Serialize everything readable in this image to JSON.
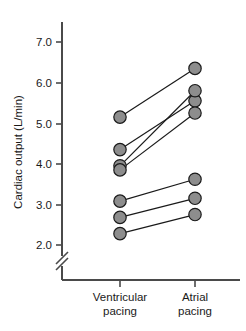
{
  "chart_data": {
    "type": "line",
    "title": "",
    "xlabel": "",
    "ylabel": "Cardiac output (L/min)",
    "categories": [
      "Ventricular pacing",
      "Atrial pacing"
    ],
    "x": [
      1,
      2
    ],
    "ylim": [
      2.0,
      7.4
    ],
    "yticks": [
      2.0,
      3.0,
      4.0,
      5.0,
      6.0,
      7.0
    ],
    "ytick_labels": [
      "2.0",
      "3.0",
      "4.0",
      "5.0",
      "6.0",
      "7.0"
    ],
    "grid": false,
    "legend": "none",
    "axis_break": true,
    "marker": "filled-gray-circle",
    "marker_color": "#8d8d8d",
    "marker_edge_color": "#1a1a1a",
    "line_color": "#1a1a1a",
    "series": [
      {
        "name": "subject-1",
        "values": [
          5.15,
          6.35
        ]
      },
      {
        "name": "subject-2",
        "values": [
          4.35,
          5.55
        ]
      },
      {
        "name": "subject-3",
        "values": [
          3.95,
          5.8
        ]
      },
      {
        "name": "subject-4",
        "values": [
          3.85,
          5.25
        ]
      },
      {
        "name": "subject-5",
        "values": [
          3.08,
          3.62
        ]
      },
      {
        "name": "subject-6",
        "values": [
          2.68,
          3.15
        ]
      },
      {
        "name": "subject-7",
        "values": [
          2.28,
          2.75
        ]
      }
    ]
  },
  "axis": {
    "y_title": "Cardiac output (L/min)",
    "ticks": [
      "7.0",
      "6.0",
      "5.0",
      "4.0",
      "3.0",
      "2.0"
    ],
    "x_categories": [
      {
        "line1": "Ventricular",
        "line2": "pacing"
      },
      {
        "line1": "Atrial",
        "line2": "pacing"
      }
    ]
  },
  "caption": {
    "label": "",
    "text": ""
  }
}
